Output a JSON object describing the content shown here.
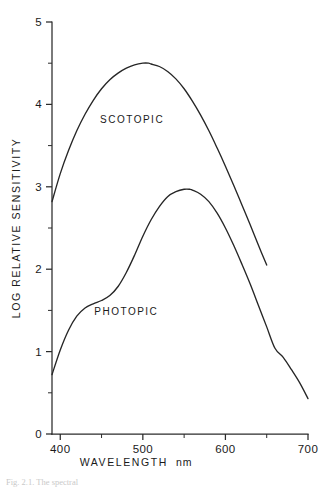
{
  "figure": {
    "caption_remnant": "Fig. 2.1.  The spectral"
  },
  "chart_data": {
    "type": "line",
    "title": "",
    "subtitle": "",
    "xlabel": "WAVELENGTH",
    "xlabel_unit": "nm",
    "ylabel": "LOG RELATIVE SENSITIVITY",
    "xlim": [
      390,
      700
    ],
    "ylim": [
      0,
      5
    ],
    "grid": false,
    "legend_position": "inline-annotations",
    "x_ticks_major": [
      400,
      500,
      600,
      700
    ],
    "x_tick_labels": [
      "400",
      "500",
      "600",
      "700"
    ],
    "x_ticks_minor": [
      450,
      550,
      650
    ],
    "y_ticks_major": [
      0,
      1,
      2,
      3,
      4,
      5
    ],
    "y_tick_labels": [
      "0",
      "1",
      "2",
      "3",
      "4",
      "5"
    ],
    "y_ticks_minor": [
      0.5,
      1.5,
      2.5,
      3.5,
      4.5
    ],
    "annotations": [
      {
        "text": "SCOTOPIC",
        "x": 487,
        "y": 3.77
      },
      {
        "text": "PHOTOPIC",
        "x": 480,
        "y": 1.44
      }
    ],
    "series": [
      {
        "name": "SCOTOPIC",
        "label": "SCOTOPIC",
        "peak_x": 507,
        "peak_y": 4.5,
        "x": [
          390,
          400,
          410,
          420,
          430,
          440,
          450,
          460,
          470,
          480,
          490,
          500,
          507,
          510,
          520,
          530,
          540,
          550,
          560,
          570,
          580,
          590,
          600,
          610,
          620,
          630,
          640,
          650
        ],
        "y": [
          2.82,
          3.16,
          3.44,
          3.68,
          3.88,
          4.05,
          4.19,
          4.3,
          4.38,
          4.44,
          4.48,
          4.5,
          4.5,
          4.49,
          4.46,
          4.4,
          4.31,
          4.19,
          4.04,
          3.87,
          3.68,
          3.47,
          3.25,
          3.02,
          2.78,
          2.54,
          2.29,
          2.05
        ]
      },
      {
        "name": "PHOTOPIC",
        "label": "PHOTOPIC",
        "peak_x": 557,
        "peak_y": 2.97,
        "x": [
          390,
          400,
          410,
          420,
          430,
          440,
          450,
          460,
          470,
          480,
          490,
          500,
          510,
          520,
          530,
          540,
          550,
          557,
          560,
          570,
          580,
          590,
          600,
          610,
          620,
          630,
          640,
          650,
          660,
          670,
          680,
          690,
          700
        ],
        "y": [
          0.72,
          1.02,
          1.26,
          1.43,
          1.53,
          1.58,
          1.62,
          1.68,
          1.79,
          1.96,
          2.17,
          2.4,
          2.6,
          2.76,
          2.88,
          2.94,
          2.97,
          2.97,
          2.96,
          2.91,
          2.82,
          2.68,
          2.5,
          2.29,
          2.06,
          1.82,
          1.56,
          1.3,
          1.04,
          0.93,
          0.78,
          0.62,
          0.43
        ]
      }
    ],
    "colors": {
      "curve": "#262626",
      "axis": "#2b2b2b",
      "background": "#ffffff"
    }
  }
}
